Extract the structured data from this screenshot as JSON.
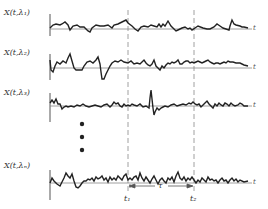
{
  "figure": {
    "traces": [
      {
        "label": "X(t,λ₁)",
        "axis_label": "t"
      },
      {
        "label": "X(t,λ₂)",
        "axis_label": "t"
      },
      {
        "label": "X(t,λ₃)",
        "axis_label": "t"
      },
      {
        "label": "X(t,λₙ)",
        "axis_label": "t"
      }
    ],
    "ellipsis": "⋮",
    "markers": {
      "t1": "t₁",
      "t2": "t₂",
      "tau": "τ"
    },
    "colors": {
      "ink": "#222222",
      "baseline": "#888888",
      "dashed": "#888888"
    }
  }
}
